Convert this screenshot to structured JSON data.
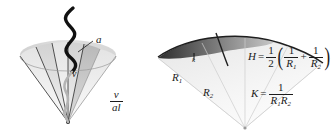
{
  "figure": {
    "background_color": "#ffffff",
    "ink_color": "#1b1b1b",
    "panels": [
      {
        "id": "left",
        "name": "wave-incidence-cone",
        "description": "Fan of radiating sectors from an apex with a wavy line entering from above"
      },
      {
        "id": "right",
        "name": "principal-curvature-cone",
        "description": "Cone with a dark curved band at the top and two radial lines labelled R1 and R2"
      }
    ]
  },
  "left_panel": {
    "label_a": "a",
    "label_v": "v",
    "fraction_v_over_al": {
      "numerator": "v",
      "denominator": "al"
    },
    "sector_count": 6,
    "wave_label": "incident-wave"
  },
  "right_panel": {
    "label_k": "k",
    "label_r1": "R",
    "label_r1_sub": "1",
    "label_r2": "R",
    "label_r2_sub": "2"
  },
  "formulas": {
    "mean_curvature": {
      "lhs": "H",
      "equals": "=",
      "half_num": "1",
      "half_den": "2",
      "open_paren": "(",
      "term1_num": "1",
      "term1_den": "R",
      "term1_den_sub": "1",
      "plus": "+",
      "term2_num": "1",
      "term2_den": "R",
      "term2_den_sub": "2",
      "close_paren": ")"
    },
    "gaussian_curvature": {
      "lhs": "K",
      "equals": "=",
      "num": "1",
      "den_r1": "R",
      "den_r1_sub": "1",
      "den_r2": "R",
      "den_r2_sub": "2"
    }
  }
}
